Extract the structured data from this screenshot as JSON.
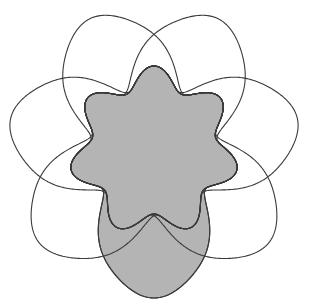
{
  "diagram": {
    "type": "symmetric-7-set-venn",
    "set_count": 7,
    "center": [
      154,
      151
    ],
    "shaded_set_index": 0,
    "colors": {
      "background": "#ffffff",
      "stroke": "#3a3a3a",
      "shaded_fill": "#b4b4b4"
    },
    "curve_shape": {
      "bump_direction_deg_of_shaded": 90,
      "bump_radius": 147,
      "bump_half_width_deg": 58,
      "inner_radius": 74,
      "wave_amplitude": 11,
      "wave_count": 7
    }
  }
}
